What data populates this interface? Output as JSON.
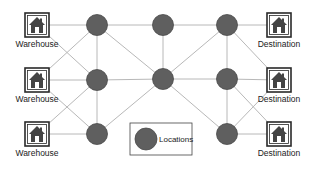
{
  "diagram": {
    "title": "",
    "colors": {
      "node_fill": "#5f5f5f",
      "edge": "#b8b8b8",
      "icon_stroke": "#2a2a2a",
      "background": "#ffffff"
    },
    "warehouses": [
      {
        "id": "W1",
        "label": "Warehouse",
        "icon": "house-icon",
        "x": 37,
        "y": 25
      },
      {
        "id": "W2",
        "label": "Warehouse",
        "icon": "house-icon",
        "x": 37,
        "y": 80
      },
      {
        "id": "W3",
        "label": "Warehouse",
        "icon": "house-icon",
        "x": 37,
        "y": 134
      }
    ],
    "destinations": [
      {
        "id": "D1",
        "label": "Destination",
        "icon": "house-icon",
        "x": 279,
        "y": 25
      },
      {
        "id": "D2",
        "label": "Destination",
        "icon": "house-icon",
        "x": 279,
        "y": 80
      },
      {
        "id": "D3",
        "label": "Destination",
        "icon": "house-icon",
        "x": 279,
        "y": 134
      }
    ],
    "locations": [
      {
        "id": "L1",
        "x": 97,
        "y": 25
      },
      {
        "id": "L2",
        "x": 97,
        "y": 80
      },
      {
        "id": "L3",
        "x": 97,
        "y": 134
      },
      {
        "id": "C1",
        "x": 163,
        "y": 25
      },
      {
        "id": "C2",
        "x": 163,
        "y": 79
      },
      {
        "id": "R1",
        "x": 227,
        "y": 25
      },
      {
        "id": "R2",
        "x": 227,
        "y": 79
      },
      {
        "id": "R3",
        "x": 227,
        "y": 134
      }
    ],
    "edges": [
      [
        "W1",
        "L1"
      ],
      [
        "W1",
        "L2"
      ],
      [
        "W2",
        "L1"
      ],
      [
        "W2",
        "L2"
      ],
      [
        "W2",
        "L3"
      ],
      [
        "W3",
        "L2"
      ],
      [
        "W3",
        "L3"
      ],
      [
        "L1",
        "L2"
      ],
      [
        "L2",
        "L3"
      ],
      [
        "L1",
        "C1"
      ],
      [
        "L1",
        "C2"
      ],
      [
        "L2",
        "C2"
      ],
      [
        "L3",
        "C2"
      ],
      [
        "C1",
        "C2"
      ],
      [
        "C1",
        "R1"
      ],
      [
        "C2",
        "R1"
      ],
      [
        "C2",
        "R2"
      ],
      [
        "C2",
        "R3"
      ],
      [
        "R1",
        "R2"
      ],
      [
        "R2",
        "R3"
      ],
      [
        "R1",
        "D1"
      ],
      [
        "R1",
        "D2"
      ],
      [
        "R2",
        "D2"
      ],
      [
        "R2",
        "D3"
      ],
      [
        "R3",
        "D2"
      ],
      [
        "R3",
        "D3"
      ]
    ],
    "legend": {
      "label": "Locations",
      "symbol": "location-node-circle"
    }
  }
}
